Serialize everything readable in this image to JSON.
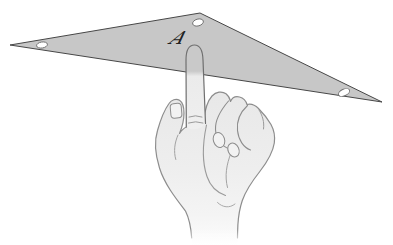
{
  "figure": {
    "label": "A",
    "background": "#ffffff",
    "triangle": {
      "points": "10,45 200,13 382,102",
      "fill": "#c7c7c7",
      "stroke": "#474747",
      "hole_fill": "#ffffff",
      "hole_stroke": "#6f6f6f",
      "holes": [
        {
          "cx": 42,
          "cy": 45,
          "rx": 5.5,
          "ry": 3.0,
          "angle": -9
        },
        {
          "cx": 198,
          "cy": 22.5,
          "rx": 5.5,
          "ry": 3.4,
          "angle": -16
        },
        {
          "cx": 344,
          "cy": 92.5,
          "rx": 6.0,
          "ry": 3.3,
          "angle": -25
        }
      ]
    },
    "label_color": "#222222",
    "hand": {
      "fill_top": "#e8e8e8",
      "fill_bottom": "#fcfcfc",
      "stroke": "#8d8d8d",
      "finger_stroke": "#6f6f6f",
      "finger_overlap_fill": "#c9c9c9",
      "nail_fill": "#f2f2f2"
    }
  }
}
